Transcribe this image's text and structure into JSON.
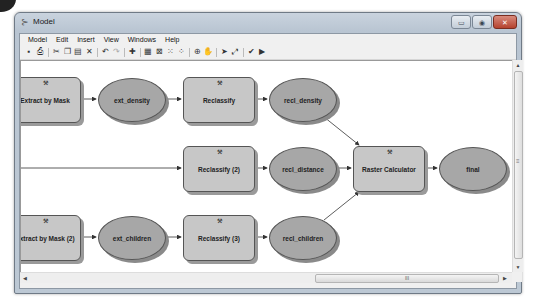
{
  "window": {
    "title": "Model",
    "buttons": {
      "minimize": "▭",
      "maximize": "◉",
      "close": "✕"
    }
  },
  "menubar": {
    "items": [
      "Model",
      "Edit",
      "Insert",
      "View",
      "Windows",
      "Help"
    ]
  },
  "toolbar": {
    "items": [
      {
        "name": "save-icon",
        "glyph": "▪"
      },
      {
        "name": "print-icon",
        "glyph": "⎙"
      },
      {
        "name": "separator"
      },
      {
        "name": "cut-icon",
        "glyph": "✂"
      },
      {
        "name": "copy-icon",
        "glyph": "❐"
      },
      {
        "name": "paste-icon",
        "glyph": "▤"
      },
      {
        "name": "delete-icon",
        "glyph": "✕"
      },
      {
        "name": "separator"
      },
      {
        "name": "undo-icon",
        "glyph": "↶"
      },
      {
        "name": "redo-icon",
        "glyph": "↷"
      },
      {
        "name": "separator"
      },
      {
        "name": "add-data-icon",
        "glyph": "✚"
      },
      {
        "name": "separator"
      },
      {
        "name": "auto-layout-icon",
        "glyph": "▦"
      },
      {
        "name": "full-extent-icon",
        "glyph": "⊠"
      },
      {
        "name": "fixed-zoom-in-icon",
        "glyph": "⁙"
      },
      {
        "name": "fixed-zoom-out-icon",
        "glyph": "⁘"
      },
      {
        "name": "separator"
      },
      {
        "name": "zoom-in-icon",
        "glyph": "⊕"
      },
      {
        "name": "pan-icon",
        "glyph": "✋"
      },
      {
        "name": "separator"
      },
      {
        "name": "select-icon",
        "glyph": "➤"
      },
      {
        "name": "connect-icon",
        "glyph": "⤢"
      },
      {
        "name": "separator"
      },
      {
        "name": "validate-icon",
        "glyph": "✔"
      },
      {
        "name": "run-icon",
        "glyph": "▶"
      }
    ]
  },
  "model": {
    "processes": [
      {
        "id": "extract1",
        "label": "Extract by Mask"
      },
      {
        "id": "reclass1",
        "label": "Reclassify"
      },
      {
        "id": "reclass2",
        "label": "Reclassify (2)"
      },
      {
        "id": "rastercalc",
        "label": "Raster Calculator"
      },
      {
        "id": "extract2",
        "label": "Extract by Mask (2)"
      },
      {
        "id": "reclass3",
        "label": "Reclassify (3)"
      }
    ],
    "data": [
      {
        "id": "ext_density",
        "label": "ext_density"
      },
      {
        "id": "recl_density",
        "label": "recl_density"
      },
      {
        "id": "recl_distance",
        "label": "recl_distance"
      },
      {
        "id": "final",
        "label": "final"
      },
      {
        "id": "ext_children",
        "label": "ext_children"
      },
      {
        "id": "recl_children",
        "label": "recl_children"
      }
    ],
    "colors": {
      "process_fill": "#c7c7c7",
      "data_fill": "#a7a7a7",
      "outline": "#555555",
      "connector": "#333333"
    }
  },
  "scrollbars": {
    "vertical_grip": "≡",
    "horizontal_grip": "III"
  }
}
